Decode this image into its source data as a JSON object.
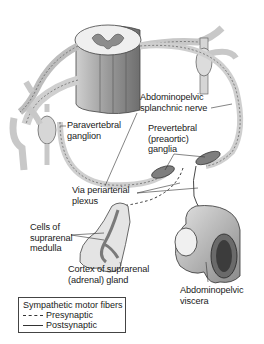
{
  "diagram": {
    "type": "anatomical-illustration",
    "colors": {
      "background": "#ffffff",
      "tissue_fill": "#e6e6e6",
      "tissue_shade": "#9a9a9a",
      "outline": "#444444",
      "label_text": "#1a1a1a"
    },
    "labels": {
      "splanchnic_nerve": "Abdominopelvic\nsplanchnic nerve",
      "paravertebral_ganglion": "Paravertebral\nganglion",
      "prevertebral_ganglia": "Prevertebral\n(preaortic)\nganglia",
      "periarterial_plexus": "Via periarterial\nplexus",
      "medulla_cells": "Cells of\nsuprarenal\nmedulla",
      "suprarenal_cortex": "Cortex of suprarenal\n(adrenal) gland",
      "viscera": "Abdominopelvic\nviscera"
    },
    "structures": [
      "spinal-cord-segment",
      "paravertebral-ganglion",
      "sympathetic-trunk",
      "abdominopelvic-splanchnic-nerve",
      "prevertebral-ganglia",
      "suprarenal-gland",
      "abdominopelvic-viscera"
    ],
    "legend": {
      "title": "Sympathetic motor fibers",
      "items": [
        {
          "style": "dashed",
          "label": "Presynaptic"
        },
        {
          "style": "solid",
          "label": "Postsynaptic"
        }
      ]
    }
  }
}
